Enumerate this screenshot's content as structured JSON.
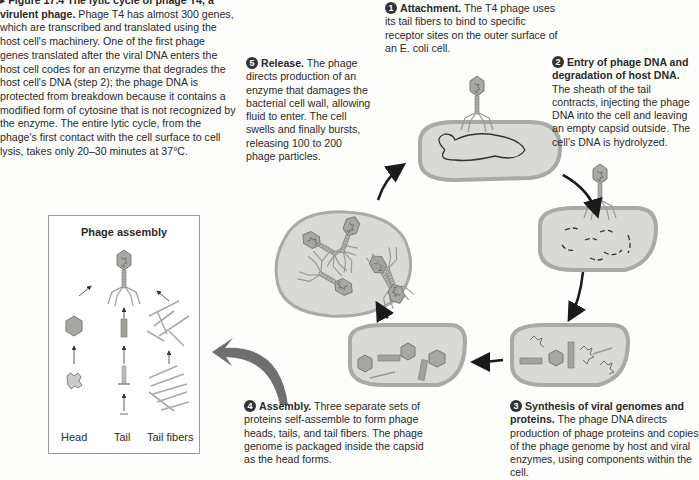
{
  "caption": {
    "marker": "▸",
    "figure_label": "Figure 17.4",
    "title": "The lytic cycle of phage T4, a virulent phage.",
    "body": "Phage T4 has almost 300 genes, which are transcribed and translated using the host cell's machinery. One of the first phage genes translated after the viral DNA enters the host cell codes for an enzyme that degrades the host cell's DNA (step 2); the phage DNA is protected from breakdown because it contains a modified form of cytosine that is not recognized by the enzyme. The entire lytic cycle, from the phage's first contact with the cell surface to cell lysis, takes only 20–30 minutes at 37°C."
  },
  "steps": [
    {
      "number": "1",
      "heading": "Attachment.",
      "text": "The T4 phage uses its tail fibers to bind to specific receptor sites on the outer surface of an E. coli cell."
    },
    {
      "number": "2",
      "heading": "Entry of phage DNA and degradation of host DNA.",
      "text": "The sheath of the tail contracts, injecting the phage DNA into the cell and leaving an empty capsid outside. The cell's DNA is hydrolyzed."
    },
    {
      "number": "3",
      "heading": "Synthesis of viral genomes and proteins.",
      "text": "The phage DNA directs production of phage proteins and copies of the phage genome by host and viral enzymes, using components within the cell."
    },
    {
      "number": "4",
      "heading": "Assembly.",
      "text": "Three separate sets of proteins self-assemble to form phage heads, tails, and tail fibers. The phage genome is packaged inside the capsid as the head forms."
    },
    {
      "number": "5",
      "heading": "Release.",
      "text": "The phage directs production of an enzyme that damages the bacterial cell wall, allowing fluid to enter. The cell swells and finally bursts, releasing 100 to 200 phage particles."
    }
  ],
  "assembly_panel": {
    "title": "Phage assembly",
    "labels": [
      "Head",
      "Tail",
      "Tail fibers"
    ]
  },
  "colors": {
    "cell_fill": "#d9d9d6",
    "cell_wall": "#a9a9a5",
    "phage": "#9c9c98",
    "arrow": "#1a1a1a",
    "big_arrow": "#6f6f6f"
  }
}
